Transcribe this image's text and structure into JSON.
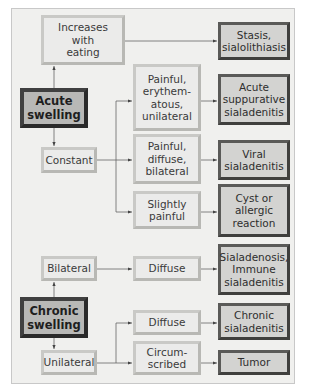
{
  "diagram": {
    "acute": {
      "origin": "Acute\nswelling",
      "branches": [
        {
          "criterion": "Increases\nwith\neating",
          "result": "Stasis,\nsialolithiasis"
        },
        {
          "criterion": "Constant",
          "sub": [
            {
              "criterion": "Painful,\nerythem-\natous,\nunilateral",
              "result": "Acute\nsuppurative\nsialadenitis"
            },
            {
              "criterion": "Painful,\ndiffuse,\nbilateral",
              "result": "Viral\nsialadenitis"
            },
            {
              "criterion": "Slightly\npainful",
              "result": "Cyst or\nallergic\nreaction"
            }
          ]
        }
      ]
    },
    "chronic": {
      "origin": "Chronic\nswelling",
      "branches": [
        {
          "criterion": "Bilateral",
          "sub": [
            {
              "criterion": "Diffuse",
              "result": "Sialadenosis,\nImmune\nsialadenitis"
            }
          ]
        },
        {
          "criterion": "Unilateral",
          "sub": [
            {
              "criterion": "Diffuse",
              "result": "Chronic\nsialadenitis"
            },
            {
              "criterion": "Circum-\nscribed",
              "result": "Tumor"
            }
          ]
        }
      ]
    }
  },
  "colors": {
    "frame_bg": "#f0f0ee",
    "light_box": "#ebebea",
    "result_box": "#d3d3d1",
    "origin_box": "#b8b8b6",
    "dark_border": "#404040",
    "line": "#555555"
  }
}
